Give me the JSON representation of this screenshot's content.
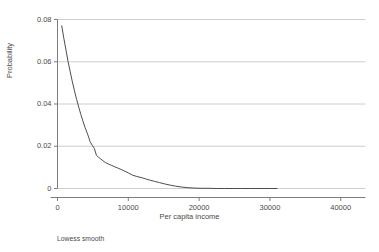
{
  "figure": {
    "footnote": "Lowess smooth"
  },
  "chart_data": {
    "type": "line",
    "title": "",
    "subtitle": "",
    "xlabel": "Per capita income",
    "ylabel": "Probability",
    "xlim": [
      0,
      43500
    ],
    "ylim": [
      0,
      0.08
    ],
    "grid": true,
    "grid_axis": "y",
    "legend": "none",
    "annotations": [
      "Lowess smooth"
    ],
    "xticks": [
      0,
      10000,
      20000,
      30000,
      40000
    ],
    "xticklabels": [
      "0",
      "10000",
      "20000",
      "30000",
      "40000"
    ],
    "yticks": [
      0,
      0.02,
      0.04,
      0.06,
      0.08
    ],
    "yticklabels": [
      "0",
      "0.02",
      "0.04",
      "0.06",
      "0.08"
    ],
    "series": [
      {
        "name": "Lowess smooth",
        "color": "#4d4d4d",
        "x": [
          600,
          900,
          1200,
          1500,
          1800,
          2100,
          2400,
          2700,
          3000,
          3300,
          3600,
          3900,
          4200,
          4400,
          4600,
          4900,
          5200,
          5500,
          5800,
          6100,
          6400,
          6800,
          7200,
          7600,
          8000,
          8500,
          9000,
          9500,
          10000,
          10600,
          11200,
          11800,
          12400,
          13000,
          13700,
          14400,
          15100,
          15900,
          16700,
          17500,
          18400,
          19300,
          20300,
          21400,
          22500,
          23600,
          24800,
          26000,
          27300,
          28600,
          29900,
          31000
        ],
        "y": [
          0.077,
          0.071,
          0.0655,
          0.06,
          0.0552,
          0.0505,
          0.0462,
          0.0422,
          0.0385,
          0.035,
          0.0318,
          0.0288,
          0.0262,
          0.0243,
          0.0222,
          0.0205,
          0.019,
          0.0157,
          0.0148,
          0.014,
          0.0132,
          0.0122,
          0.0116,
          0.011,
          0.0104,
          0.0097,
          0.009,
          0.0082,
          0.0074,
          0.0063,
          0.0057,
          0.0052,
          0.0046,
          0.004,
          0.0034,
          0.0028,
          0.0022,
          0.0016,
          0.0011,
          0.0007,
          0.0004,
          0.0002,
          0.0001,
          0.0001,
          0.0,
          0.0,
          0.0,
          0.0,
          0.0,
          0.0,
          0.0,
          0.0
        ]
      }
    ]
  },
  "colors": {
    "line": "#4d4d4d",
    "grid": "#c8c8c8",
    "axis": "#6e6e6e",
    "text": "#4a4a4a"
  }
}
